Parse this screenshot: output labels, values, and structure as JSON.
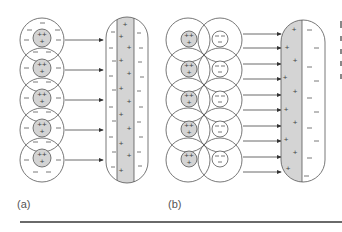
{
  "figure": {
    "panels": [
      {
        "label": "(a)",
        "description": "Atoms with positive nuclei and surrounding negative charges, each field pointing to an elongated molecule with positive core and negative sheath",
        "atoms": 5,
        "arrows": 5,
        "nucleus_charge": "++ +",
        "cloud_charge": "—"
      },
      {
        "label": "(b)",
        "description": "Pairs of positive and negative charge clouds inducing a polarized molecule with positive half and negative half",
        "atom_pairs": 5,
        "arrows": 10,
        "positive_charge": "++ +",
        "negative_charge": "— —"
      }
    ],
    "colors": {
      "stroke": "#555555",
      "shade": "#d4d4d4",
      "background": "#ffffff"
    }
  }
}
